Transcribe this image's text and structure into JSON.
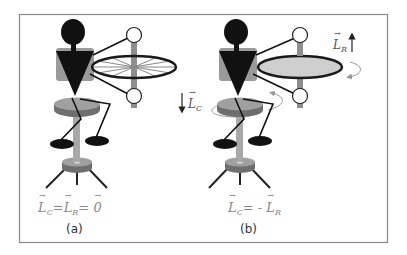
{
  "frame": {
    "x": 19,
    "y": 14,
    "width": 368,
    "height": 228,
    "stroke": "#8a8a8a"
  },
  "colors": {
    "figure_black": "#111111",
    "body_gray": "#9a9a9a",
    "pole_gray": "#a8a8a8",
    "stool_top": "#a0a0a0",
    "stool_side": "#6e6e6e",
    "wheel_rim": "#1a1a1a",
    "wheel_fill_b": "#cfcfcf",
    "spoke": "#777777",
    "rotation_arrow": "#9a9a9a",
    "label_text": "#666666"
  },
  "panels": [
    {
      "id": "a",
      "caption": "(a)",
      "equation": {
        "L": "L",
        "sub_c": "C",
        "eq1": "=",
        "sub_r": "R",
        "eq2": "=",
        "zero": "0"
      },
      "wheel_spinning": false,
      "stool_spinning": false
    },
    {
      "id": "b",
      "caption": "(b)",
      "equation": {
        "L": "L",
        "sub_c": "C",
        "eq1": "= -",
        "sub_r": "R"
      },
      "wheel_spinning": true,
      "stool_spinning": true,
      "labels": {
        "lr": {
          "L": "L",
          "sub": "R",
          "direction": "up"
        },
        "lc": {
          "L": "L",
          "sub": "C",
          "direction": "down"
        }
      }
    }
  ]
}
